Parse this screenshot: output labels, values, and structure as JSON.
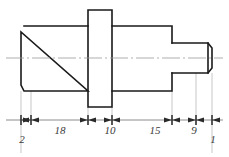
{
  "drawing": {
    "title": "Stepped Shaft Technical Drawing",
    "type": "engineering-part-outline",
    "view": "front-elevation-section",
    "colors": {
      "outline": "#1a1a1a",
      "centerline": "#9a9a9a",
      "extension_line": "#b0b0b0",
      "dimension_line": "#6f6f6f",
      "text": "#3a3a3a",
      "background": "#ffffff"
    },
    "centerline": {
      "label": "axis-centerline",
      "y": 58,
      "x_start": 6,
      "x_end": 223
    },
    "part": {
      "name": "stepped-shaft",
      "segments": [
        {
          "name": "left-chamfer",
          "x_start": 21,
          "x_end": 24,
          "top": 26,
          "bottom": 91,
          "chamfered": true
        },
        {
          "name": "left-cylinder",
          "x_start": 24,
          "x_end": 88,
          "top": 26,
          "bottom": 91,
          "chamfered": false
        },
        {
          "name": "center-flange",
          "x_start": 88,
          "x_end": 112,
          "top": 10,
          "bottom": 107,
          "chamfered": false
        },
        {
          "name": "right-cylinder",
          "x_start": 112,
          "x_end": 172,
          "top": 26,
          "bottom": 91,
          "chamfered": false
        },
        {
          "name": "small-end-cylinder",
          "x_start": 172,
          "x_end": 208,
          "top": 43,
          "bottom": 73,
          "chamfered": false
        },
        {
          "name": "right-chamfer",
          "x_start": 208,
          "x_end": 212,
          "top": 43,
          "bottom": 73,
          "chamfered": true
        }
      ]
    },
    "dimension_line": {
      "name": "main-dimension-chain",
      "y": 120,
      "x_start": 6,
      "x_end": 223,
      "tick_positions": [
        21,
        31,
        88,
        112,
        172,
        196,
        212
      ]
    },
    "dimensions": [
      {
        "label": "2",
        "value": 2,
        "x_start": 21,
        "x_end": 31,
        "text_x": 22,
        "text_y": 143,
        "placement": "below-leader"
      },
      {
        "label": "18",
        "value": 18,
        "x_start": 31,
        "x_end": 88,
        "text_x": 60,
        "text_y": 134,
        "placement": "inline"
      },
      {
        "label": "10",
        "value": 10,
        "x_start": 88,
        "x_end": 112,
        "text_x": 110,
        "text_y": 134,
        "placement": "inline"
      },
      {
        "label": "15",
        "value": 15,
        "x_start": 112,
        "x_end": 172,
        "text_x": 155,
        "text_y": 134,
        "placement": "inline"
      },
      {
        "label": "9",
        "value": 9,
        "x_start": 172,
        "x_end": 196,
        "text_x": 194,
        "text_y": 134,
        "placement": "inline"
      },
      {
        "label": "1",
        "value": 1,
        "x_start": 196,
        "x_end": 212,
        "text_x": 213,
        "text_y": 143,
        "placement": "below-leader"
      }
    ],
    "extension_lines": [
      {
        "name": "ext-left-face",
        "x": 21,
        "y_top": 91,
        "y_bottom": 153
      },
      {
        "name": "ext-left-chamfer-end",
        "x": 31,
        "y_top": 91,
        "y_bottom": 125
      },
      {
        "name": "ext-flange-left",
        "x": 88,
        "y_top": 107,
        "y_bottom": 125
      },
      {
        "name": "ext-flange-right",
        "x": 112,
        "y_top": 107,
        "y_bottom": 125
      },
      {
        "name": "ext-step-shoulder",
        "x": 172,
        "y_top": 91,
        "y_bottom": 125
      },
      {
        "name": "ext-chamfer-start",
        "x": 196,
        "y_top": 73,
        "y_bottom": 125
      },
      {
        "name": "ext-right-face",
        "x": 212,
        "y_top": 73,
        "y_bottom": 153
      }
    ]
  }
}
